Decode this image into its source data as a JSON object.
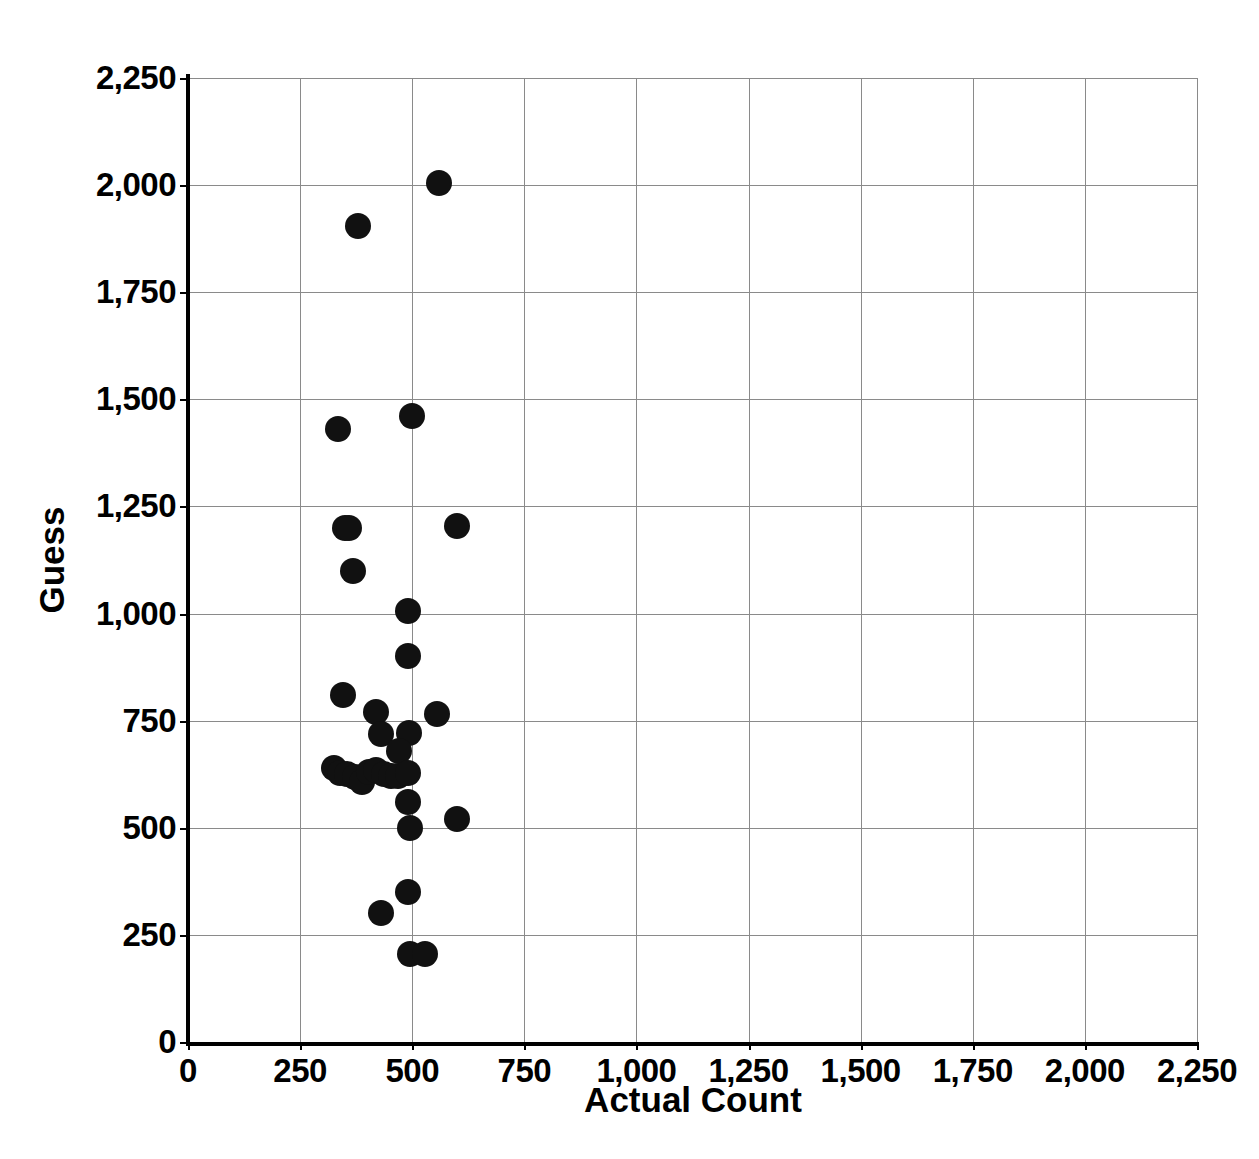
{
  "chart_data": {
    "type": "scatter",
    "title": "",
    "xlabel": "Actual Count",
    "ylabel": "Guess",
    "xlim": [
      0,
      2250
    ],
    "ylim": [
      0,
      2250
    ],
    "xticks": [
      0,
      250,
      500,
      750,
      1000,
      1250,
      1500,
      1750,
      2000,
      2250
    ],
    "yticks": [
      0,
      250,
      500,
      750,
      1000,
      1250,
      1500,
      1750,
      2000,
      2250
    ],
    "xtick_labels": [
      "0",
      "250",
      "500",
      "750",
      "1,000",
      "1,250",
      "1,500",
      "1,750",
      "2,000",
      "2,250"
    ],
    "ytick_labels": [
      "0",
      "250",
      "500",
      "750",
      "1,000",
      "1,250",
      "1,500",
      "1,750",
      "2,000",
      "2,250"
    ],
    "grid": true,
    "legend": "none",
    "marker_color": "#111111",
    "marker_size": 26,
    "points": [
      {
        "x": 560,
        "y": 2005
      },
      {
        "x": 380,
        "y": 1905
      },
      {
        "x": 500,
        "y": 1460
      },
      {
        "x": 335,
        "y": 1430
      },
      {
        "x": 600,
        "y": 1205
      },
      {
        "x": 350,
        "y": 1200
      },
      {
        "x": 358,
        "y": 1200
      },
      {
        "x": 368,
        "y": 1100
      },
      {
        "x": 490,
        "y": 1005
      },
      {
        "x": 490,
        "y": 900
      },
      {
        "x": 345,
        "y": 810
      },
      {
        "x": 555,
        "y": 765
      },
      {
        "x": 420,
        "y": 770
      },
      {
        "x": 430,
        "y": 718
      },
      {
        "x": 492,
        "y": 722
      },
      {
        "x": 470,
        "y": 680
      },
      {
        "x": 325,
        "y": 640
      },
      {
        "x": 340,
        "y": 628
      },
      {
        "x": 355,
        "y": 625
      },
      {
        "x": 372,
        "y": 618
      },
      {
        "x": 388,
        "y": 608
      },
      {
        "x": 404,
        "y": 630
      },
      {
        "x": 420,
        "y": 635
      },
      {
        "x": 436,
        "y": 625
      },
      {
        "x": 452,
        "y": 622
      },
      {
        "x": 468,
        "y": 620
      },
      {
        "x": 490,
        "y": 628
      },
      {
        "x": 490,
        "y": 560
      },
      {
        "x": 495,
        "y": 500
      },
      {
        "x": 600,
        "y": 520
      },
      {
        "x": 490,
        "y": 350
      },
      {
        "x": 430,
        "y": 300
      },
      {
        "x": 495,
        "y": 205
      },
      {
        "x": 528,
        "y": 205
      }
    ]
  }
}
